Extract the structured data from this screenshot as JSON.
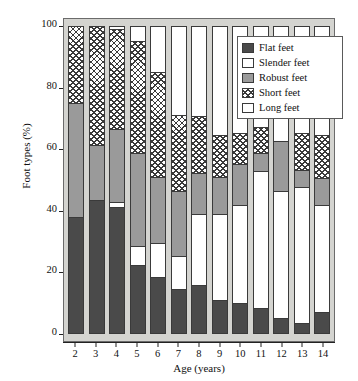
{
  "chart_data": {
    "type": "bar",
    "subtype": "stacked-bar-100-percent",
    "title": "",
    "xlabel": "Age (years)",
    "ylabel": "Foot types (%)",
    "categories": [
      "2",
      "3",
      "4",
      "5",
      "6",
      "7",
      "8",
      "9",
      "10",
      "11",
      "12",
      "13",
      "14"
    ],
    "ylim": [
      0,
      100
    ],
    "yticks": [
      0,
      20,
      40,
      60,
      80,
      100
    ],
    "ytick_labels": [
      "0",
      "20",
      "40",
      "60",
      "80",
      "100"
    ],
    "grid": false,
    "legend_position": "top-right-inside",
    "series": [
      {
        "name": "Flat feet",
        "pattern": "solid-dark",
        "color": "#4a4a4a",
        "values": [
          37.5,
          43.0,
          41.0,
          22.0,
          18.0,
          14.0,
          15.5,
          10.5,
          9.5,
          8.0,
          4.5,
          3.0,
          6.5
        ]
      },
      {
        "name": "Slender feet",
        "pattern": "dotted",
        "color": "#ffffff",
        "values": [
          0.0,
          0.0,
          1.5,
          6.0,
          11.0,
          11.0,
          23.0,
          28.0,
          32.0,
          44.5,
          41.5,
          44.5,
          35.0
        ]
      },
      {
        "name": "Robust feet",
        "pattern": "solid-gray",
        "color": "#9a9a9a",
        "values": [
          37.5,
          18.0,
          24.0,
          30.5,
          21.5,
          21.0,
          13.5,
          12.0,
          13.5,
          6.0,
          16.5,
          5.5,
          9.0
        ]
      },
      {
        "name": "Short feet",
        "pattern": "crosshatch",
        "color": "#ffffff",
        "values": [
          25.0,
          39.0,
          32.5,
          36.5,
          34.5,
          25.0,
          18.5,
          14.0,
          10.0,
          8.5,
          0.0,
          12.0,
          14.0
        ]
      },
      {
        "name": "Long feet",
        "pattern": "blank",
        "color": "#ffffff",
        "values": [
          0.0,
          0.0,
          1.0,
          5.0,
          15.0,
          29.0,
          29.5,
          35.5,
          35.0,
          33.0,
          37.5,
          35.0,
          35.5
        ]
      }
    ]
  },
  "legend": {
    "items": [
      {
        "label": "Flat feet",
        "pattern": "solid-dark"
      },
      {
        "label": "Slender feet",
        "pattern": "dotted"
      },
      {
        "label": "Robust feet",
        "pattern": "solid-gray"
      },
      {
        "label": "Short feet",
        "pattern": "crosshatch"
      },
      {
        "label": "Long feet",
        "pattern": "blank"
      }
    ]
  },
  "colors": {
    "panel_background": "#d4d4d0",
    "flat": "#4a4a4a",
    "robust": "#9a9a9a",
    "outline": "#3a3a3a",
    "text": "#111111"
  }
}
